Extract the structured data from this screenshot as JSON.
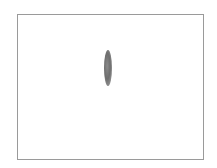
{
  "figure": {
    "shape": "ellipse",
    "orientation": "vertical",
    "colors": {
      "border": "#9a9a9a",
      "background": "#ffffff",
      "shape_fill": "#6e6e6e"
    }
  }
}
